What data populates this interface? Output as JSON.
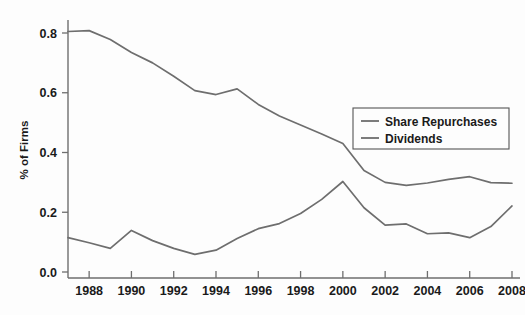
{
  "chart_data": {
    "type": "line",
    "title": "",
    "subtitle": "",
    "xlabel": "",
    "ylabel": "% of Firms",
    "xlim": [
      1987,
      2008
    ],
    "ylim": [
      0.0,
      0.84
    ],
    "grid": false,
    "legend_position": "center-right",
    "x": [
      1987,
      1988,
      1989,
      1990,
      1991,
      1992,
      1993,
      1994,
      1995,
      1996,
      1997,
      1998,
      1999,
      2000,
      2001,
      2002,
      2003,
      2004,
      2005,
      2006,
      2007,
      2008
    ],
    "xticks": [
      1988,
      1990,
      1992,
      1994,
      1996,
      1998,
      2000,
      2002,
      2004,
      2006,
      2008
    ],
    "xtick_labels": [
      "1988",
      "1990",
      "1992",
      "1994",
      "1996",
      "1998",
      "2000",
      "2002",
      "2004",
      "2006",
      "2008"
    ],
    "yticks": [
      0.0,
      0.2,
      0.4,
      0.6,
      0.8
    ],
    "ytick_labels": [
      "0.0",
      "0.2",
      "0.4",
      "0.6",
      "0.8"
    ],
    "series": [
      {
        "name": "Share Repurchases",
        "color": "#6e6e6e",
        "values": [
          0.115,
          0.098,
          0.079,
          0.139,
          0.105,
          0.079,
          0.059,
          0.073,
          0.112,
          0.145,
          0.162,
          0.196,
          0.243,
          0.303,
          0.215,
          0.157,
          0.161,
          0.128,
          0.131,
          0.115,
          0.152,
          0.221
        ]
      },
      {
        "name": "Dividends",
        "color": "#6e6e6e",
        "values": [
          0.805,
          0.808,
          0.778,
          0.735,
          0.7,
          0.655,
          0.607,
          0.594,
          0.613,
          0.561,
          0.522,
          0.492,
          0.462,
          0.43,
          0.34,
          0.3,
          0.29,
          0.298,
          0.31,
          0.319,
          0.299,
          0.297
        ]
      }
    ],
    "legend": [
      {
        "label": "Share Repurchases",
        "color": "#6e6e6e"
      },
      {
        "label": "Dividends",
        "color": "#6e6e6e"
      }
    ]
  },
  "axes": {
    "y_axis_title": "% of Firms"
  }
}
